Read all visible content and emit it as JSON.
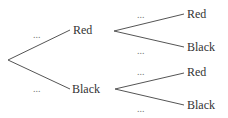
{
  "tree": {
    "level1": [
      {
        "label": "Red",
        "prob": "..."
      },
      {
        "label": "Black",
        "prob": "..."
      }
    ],
    "level2_from_red": [
      {
        "label": "Red",
        "prob": "..."
      },
      {
        "label": "Black",
        "prob": "..."
      }
    ],
    "level2_from_black": [
      {
        "label": "Red",
        "prob": "..."
      },
      {
        "label": "Black",
        "prob": "..."
      }
    ]
  },
  "colors": {
    "line": "#555555",
    "text": "#333333"
  }
}
